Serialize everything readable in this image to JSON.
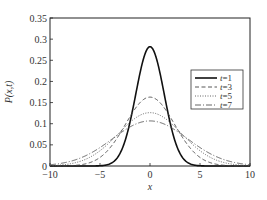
{
  "chart_data": {
    "type": "line",
    "title": "",
    "xlabel": "x",
    "ylabel": "P(x,t)",
    "xlim": [
      -10,
      10
    ],
    "ylim": [
      0,
      0.35
    ],
    "xticks": [
      -10,
      -5,
      0,
      5,
      10
    ],
    "xtick_labels": [
      "−10",
      "−5",
      "0",
      "5",
      "10"
    ],
    "yticks": [
      0,
      0.05,
      0.1,
      0.15,
      0.2,
      0.25,
      0.3,
      0.35
    ],
    "ytick_labels": [
      "0",
      "0.05",
      "0.1",
      "0.15",
      "0.2",
      "0.25",
      "0.3",
      "0.35"
    ],
    "grid": false,
    "legend_position": "center-right",
    "formula": "P(x,t) = exp(-x^2/(4t)) / sqrt(4*pi*t)",
    "series": [
      {
        "name": "t=1",
        "t": 1,
        "style": "solid",
        "width": 1.6,
        "color": "#111111",
        "peak": 0.282,
        "x": [
          -10,
          -8,
          -6,
          -4,
          -3,
          -2,
          -1,
          0,
          1,
          2,
          3,
          4,
          6,
          8,
          10
        ],
        "values": [
          0.0,
          0.0,
          0.0,
          0.005,
          0.03,
          0.104,
          0.22,
          0.282,
          0.22,
          0.104,
          0.03,
          0.005,
          0.0,
          0.0,
          0.0
        ]
      },
      {
        "name": "t=3",
        "t": 3,
        "style": "dashed",
        "width": 0.9,
        "color": "#444444",
        "peak": 0.163,
        "x": [
          -10,
          -8,
          -6,
          -4,
          -3,
          -2,
          -1,
          0,
          1,
          2,
          3,
          4,
          6,
          8,
          10
        ],
        "values": [
          0.0004,
          0.0008,
          0.008,
          0.043,
          0.077,
          0.117,
          0.15,
          0.163,
          0.15,
          0.117,
          0.077,
          0.043,
          0.008,
          0.0008,
          0.0004
        ]
      },
      {
        "name": "t=5",
        "t": 5,
        "style": "dotted",
        "width": 0.9,
        "color": "#555555",
        "peak": 0.126,
        "x": [
          -10,
          -8,
          -6,
          -4,
          -3,
          -2,
          -1,
          0,
          1,
          2,
          3,
          4,
          6,
          8,
          10
        ],
        "values": [
          0.0008,
          0.005,
          0.021,
          0.057,
          0.08,
          0.103,
          0.12,
          0.126,
          0.12,
          0.103,
          0.08,
          0.057,
          0.021,
          0.005,
          0.0008
        ]
      },
      {
        "name": "t=7",
        "t": 7,
        "style": "dash-dot",
        "width": 0.9,
        "color": "#555555",
        "peak": 0.107,
        "x": [
          -10,
          -8,
          -6,
          -4,
          -3,
          -2,
          -1,
          0,
          1,
          2,
          3,
          4,
          6,
          8,
          10
        ],
        "values": [
          0.003,
          0.011,
          0.029,
          0.061,
          0.077,
          0.093,
          0.103,
          0.107,
          0.103,
          0.093,
          0.077,
          0.061,
          0.029,
          0.011,
          0.003
        ]
      }
    ]
  },
  "legend": {
    "items": [
      {
        "var": "t",
        "eq": "=1"
      },
      {
        "var": "t",
        "eq": "=3"
      },
      {
        "var": "t",
        "eq": "=5"
      },
      {
        "var": "t",
        "eq": "=7"
      }
    ]
  },
  "labels": {
    "xlabel": "x",
    "ylabel": "P(x,t)"
  }
}
